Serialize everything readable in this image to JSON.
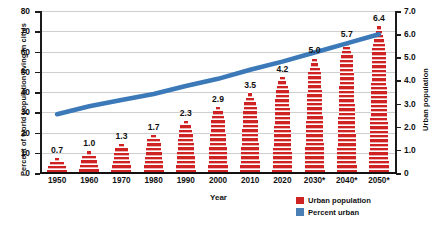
{
  "chart_data": {
    "type": "bar",
    "title": "",
    "subtitle": "",
    "xlabel": "Year",
    "ylabel": "Percent of world population living in cities",
    "y2label": "Urban population",
    "categories": [
      "1950",
      "1960",
      "1970",
      "1980",
      "1990",
      "2000",
      "2010",
      "2020",
      "2030*",
      "2040*",
      "2050*"
    ],
    "ylim": [
      0,
      80
    ],
    "yticks": [
      "0",
      "10",
      "20",
      "30",
      "40",
      "50",
      "60",
      "70",
      "80"
    ],
    "y2lim": [
      0,
      7.0
    ],
    "y2ticks": [
      "0",
      "1.0",
      "2.0",
      "3.0",
      "4.0",
      "5.0",
      "6.0",
      "7.0"
    ],
    "grid": true,
    "legend_position": "bottom-right",
    "series": [
      {
        "name": "Urban population",
        "type": "bar",
        "axis": "right",
        "color": "#cf2222",
        "values": [
          0.7,
          1.0,
          1.3,
          1.7,
          2.3,
          2.9,
          3.5,
          4.2,
          5.0,
          5.7,
          6.4
        ],
        "data_labels": [
          "0.7",
          "1.0",
          "1.3",
          "1.7",
          "2.3",
          "2.9",
          "3.5",
          "4.2",
          "5.0",
          "5.7",
          "6.4"
        ]
      },
      {
        "name": "Percent urban",
        "type": "line",
        "axis": "left",
        "color": "#3b79b8",
        "values": [
          29,
          33,
          36,
          39,
          43,
          46.5,
          51,
          55,
          59.5,
          64,
          68.5
        ]
      }
    ]
  },
  "legend": {
    "items": [
      {
        "label": "Urban population",
        "color": "#cf2222"
      },
      {
        "label": "Percent urban",
        "color": "#4a7fb5"
      }
    ]
  },
  "source_note": ""
}
